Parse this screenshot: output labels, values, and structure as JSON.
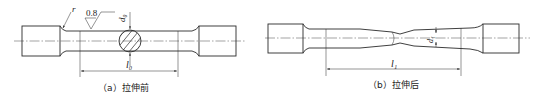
{
  "figure_a": {
    "caption": "（a）拉伸前",
    "radius_label": "r",
    "roughness_value": "0.8",
    "diameter_label": "d₀",
    "gauge_length_label": "l₀"
  },
  "figure_b": {
    "caption": "（b）拉伸后",
    "neck_diameter_label": "d₁",
    "gauge_length_label": "l₁"
  }
}
